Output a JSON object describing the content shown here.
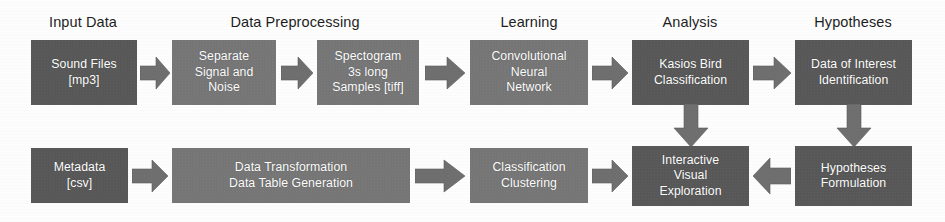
{
  "diagram": {
    "canvas": {
      "width": 945,
      "height": 222
    },
    "colors": {
      "background": "#fdfdfd",
      "node_dark": "#585858",
      "node_mid": "#767676",
      "arrow": "#6f6f6f",
      "label_text": "#1d1d1d",
      "node_text": "#ffffff"
    },
    "stage_labels": [
      {
        "id": "stage-input-data",
        "text": "Input Data"
      },
      {
        "id": "stage-data-preprocessing",
        "text": "Data Preprocessing"
      },
      {
        "id": "stage-learning",
        "text": "Learning"
      },
      {
        "id": "stage-analysis",
        "text": "Analysis"
      },
      {
        "id": "stage-hypotheses",
        "text": "Hypotheses"
      }
    ],
    "nodes": {
      "sound_files": {
        "line1": "Sound Files",
        "line2": "[mp3]"
      },
      "separate_signal": {
        "line1": "Separate",
        "line2": "Signal and",
        "line3": "Noise"
      },
      "spectogram": {
        "line1": "Spectogram",
        "line2": "3s long",
        "line3": "Samples [tiff]"
      },
      "cnn": {
        "line1": "Convolutional",
        "line2": "Neural",
        "line3": "Network"
      },
      "kasios": {
        "line1": "Kasios Bird",
        "line2": "Classification"
      },
      "data_of_interest": {
        "line1": "Data of Interest",
        "line2": "Identification"
      },
      "metadata": {
        "line1": "Metadata",
        "line2": "[csv]"
      },
      "data_transformation": {
        "line1": "Data Transformation",
        "line2": "Data Table Generation"
      },
      "classification_clustering": {
        "line1": "Classification",
        "line2": "Clustering"
      },
      "interactive_visual": {
        "line1": "Interactive",
        "line2": "Visual",
        "line3": "Exploration"
      },
      "hypotheses_formulation": {
        "line1": "Hypotheses",
        "line2": "Formulation"
      }
    },
    "arrows": [
      {
        "id": "arrow-sound-to-separate",
        "direction": "right"
      },
      {
        "id": "arrow-separate-to-spectogram",
        "direction": "right"
      },
      {
        "id": "arrow-spectogram-to-cnn",
        "direction": "right"
      },
      {
        "id": "arrow-cnn-to-kasios",
        "direction": "right"
      },
      {
        "id": "arrow-kasios-to-data-of-interest",
        "direction": "right"
      },
      {
        "id": "arrow-metadata-to-transformation",
        "direction": "right"
      },
      {
        "id": "arrow-transformation-to-clustering",
        "direction": "right"
      },
      {
        "id": "arrow-clustering-to-exploration",
        "direction": "right"
      },
      {
        "id": "arrow-formulation-to-exploration",
        "direction": "left"
      },
      {
        "id": "arrow-kasios-down",
        "direction": "down"
      },
      {
        "id": "arrow-data-of-interest-down",
        "direction": "down"
      }
    ]
  }
}
